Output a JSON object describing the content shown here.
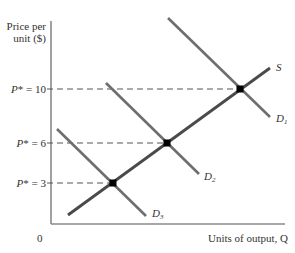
{
  "diagram": {
    "y_axis_label_line1": "Price per",
    "y_axis_label_line2": "unit ($)",
    "x_axis_label": "Units of output, Q",
    "origin_label": "0",
    "price_levels": [
      {
        "label": "P* = 10",
        "p_symbol": "P",
        "star_eq": "* = 10",
        "value": 10
      },
      {
        "label": "P* = 6",
        "p_symbol": "P",
        "star_eq": "* = 6",
        "value": 6
      },
      {
        "label": "P* = 3",
        "p_symbol": "P",
        "star_eq": "* = 3",
        "value": 3
      }
    ],
    "curves": {
      "supply": {
        "label": "S"
      },
      "demand1": {
        "label_main": "D",
        "label_sub": "1"
      },
      "demand2": {
        "label_main": "D",
        "label_sub": "2"
      },
      "demand3": {
        "label_main": "D",
        "label_sub": "3"
      }
    },
    "colors": {
      "axis": "#8a8a8a",
      "supply": "#4a4a4a",
      "demand": "#6e6e6e",
      "dashed": "#555555",
      "point": "#000000",
      "text": "#333333"
    }
  }
}
